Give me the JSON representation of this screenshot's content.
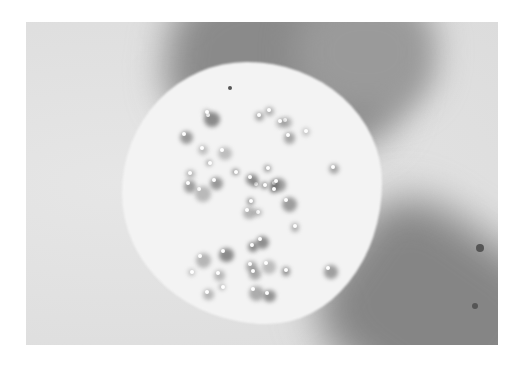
{
  "image": {
    "description": "Grayscale photograph of a round specimen disc with scattered dark spots and bright granules, over a light background crossed by a dark diagonal band",
    "tones": {
      "background": "#e2e2e2",
      "band": "#888888",
      "disc": "#f3f3f3",
      "spot": "#6e6e6e",
      "granule": "#ffffff"
    }
  }
}
